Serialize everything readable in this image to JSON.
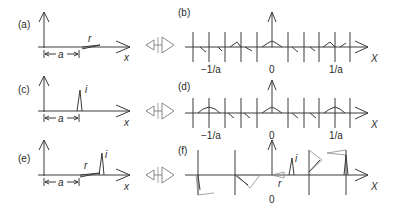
{
  "panels": {
    "a": {
      "label": "(a)",
      "symbol_r": "r",
      "symbol_a": "a",
      "axis_x": "x"
    },
    "b": {
      "label": "(b)",
      "tick_neg": "−1/a",
      "tick_zero": "0",
      "tick_pos": "1/a",
      "axis_X": "X"
    },
    "c": {
      "label": "(c)",
      "symbol_i": "i",
      "symbol_a": "a",
      "axis_x": "x"
    },
    "d": {
      "label": "(d)",
      "tick_neg": "−1/a",
      "tick_zero": "0",
      "tick_pos": "1/a",
      "axis_X": "X"
    },
    "e": {
      "label": "(e)",
      "symbol_r": "r",
      "symbol_i": "i",
      "symbol_a": "a",
      "axis_x": "x"
    },
    "f": {
      "label": "(f)",
      "symbol_r": "r",
      "symbol_i": "i",
      "tick_zero": "0",
      "axis_X": "X"
    }
  },
  "transform_symbol": "fourier-transform-pair-icon"
}
